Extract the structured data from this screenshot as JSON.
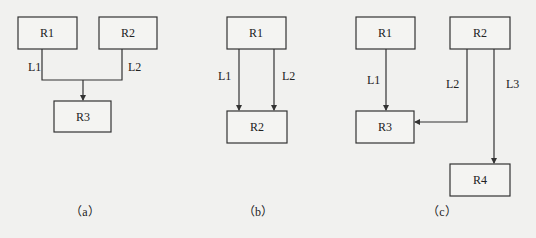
{
  "panels": {
    "a": {
      "caption": "（a）",
      "nodes": [
        "R1",
        "R2",
        "R3"
      ],
      "links": [
        {
          "label": "L1",
          "from": "R1",
          "to": "R3"
        },
        {
          "label": "L2",
          "from": "R2",
          "to": "R3"
        }
      ]
    },
    "b": {
      "caption": "（b）",
      "nodes": [
        "R1",
        "R2"
      ],
      "links": [
        {
          "label": "L1",
          "from": "R1",
          "to": "R2"
        },
        {
          "label": "L2",
          "from": "R1",
          "to": "R2"
        }
      ]
    },
    "c": {
      "caption": "（c）",
      "nodes": [
        "R1",
        "R2",
        "R3",
        "R4"
      ],
      "links": [
        {
          "label": "L1",
          "from": "R1",
          "to": "R3"
        },
        {
          "label": "L2",
          "from": "R2",
          "to": "R3"
        },
        {
          "label": "L3",
          "from": "R2",
          "to": "R4"
        }
      ]
    }
  }
}
